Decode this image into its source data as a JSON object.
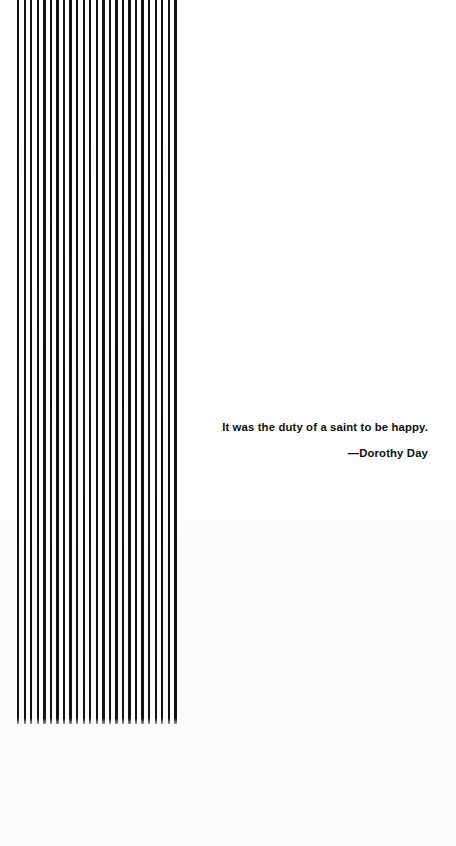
{
  "page": {
    "kind": "book-epigraph-page",
    "background_color": "#fdfdfd",
    "ink_color": "#101010",
    "width": 456,
    "height": 846
  },
  "ornament": {
    "name": "vertical-stripe-band",
    "stripe_color": "#121212",
    "stripe_count": 25,
    "stripe_width_px": 2.4,
    "stripe_pitch_px": 6.55,
    "band_left_px": 17,
    "band_top_px": 0,
    "band_width_px": 163,
    "band_height_px": 724
  },
  "quote": {
    "text": "It was the duty of a saint to be happy.",
    "attribution": "—Dorothy Day"
  }
}
